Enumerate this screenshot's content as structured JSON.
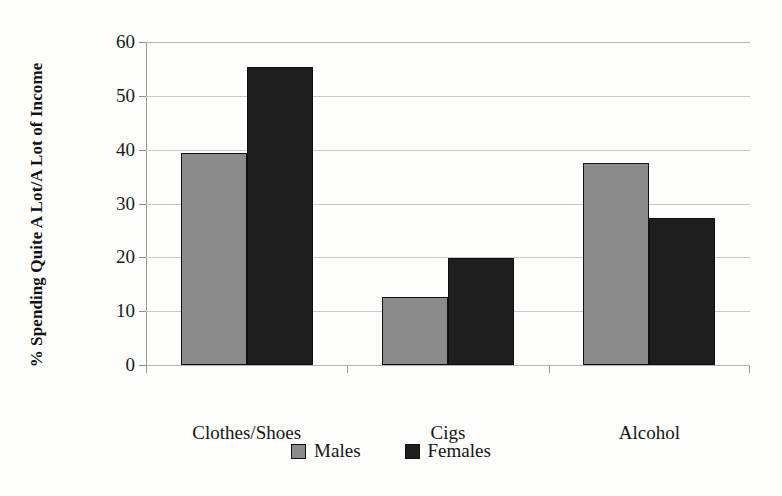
{
  "chart_data": {
    "type": "bar",
    "title": "",
    "subtitle": "",
    "xlabel": "",
    "ylabel": "% Spending Quite A Lot/A Lot of Income",
    "categories": [
      "Clothes/Shoes",
      "Cigs",
      "Alcohol"
    ],
    "series": [
      {
        "name": "Males",
        "color": "#8b8b8b",
        "values": [
          39.4,
          12.6,
          37.6
        ]
      },
      {
        "name": "Females",
        "color": "#1e1e1e",
        "values": [
          55.4,
          19.8,
          27.3
        ]
      }
    ],
    "ylim": [
      0,
      60
    ],
    "yticks": [
      "0",
      "10",
      "20",
      "30",
      "40",
      "50",
      "60"
    ],
    "ytick_values": [
      0,
      10,
      20,
      30,
      40,
      50,
      60
    ],
    "grid": true,
    "legend_position": "bottom"
  },
  "legend": {
    "items": [
      {
        "label": "Males",
        "swatch": "males-swatch"
      },
      {
        "label": "Females",
        "swatch": "females-swatch"
      }
    ]
  }
}
